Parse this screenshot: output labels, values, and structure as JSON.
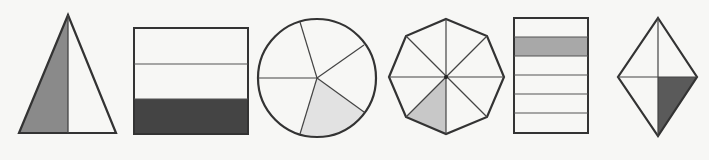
{
  "figure": {
    "background": "#f7f7f5",
    "stroke_color": "#333333",
    "shapes": [
      {
        "id": "triangle",
        "type": "isosceles-triangle",
        "parts": 2,
        "shaded_parts": 1,
        "fraction": "1/2",
        "shade_color": "#8a8a8a"
      },
      {
        "id": "rectangle-horizontal-thirds",
        "type": "rectangle",
        "parts": 3,
        "shaded_parts": 1,
        "fraction": "1/3",
        "shade_color": "#444444"
      },
      {
        "id": "circle",
        "type": "circle",
        "parts": 5,
        "shaded_parts": 1,
        "fraction": "1/5",
        "shade_color": "#e2e2e2",
        "note": "sectors appear unequal"
      },
      {
        "id": "octagon",
        "type": "regular-octagon",
        "parts": 8,
        "shaded_parts": 1,
        "fraction": "1/8",
        "shade_color": "#c8c8c8"
      },
      {
        "id": "rectangle-sixths",
        "type": "rectangle",
        "parts": 6,
        "shaded_parts": 1,
        "fraction": "1/6",
        "shade_color": "#a8a8a8"
      },
      {
        "id": "rhombus",
        "type": "rhombus",
        "parts": 4,
        "shaded_parts": 1,
        "fraction": "1/4",
        "shade_color": "#5a5a5a"
      }
    ]
  }
}
